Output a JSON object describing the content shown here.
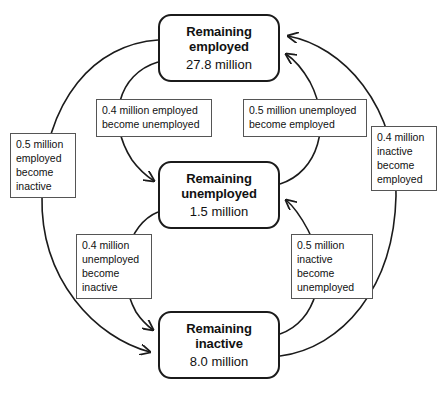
{
  "diagram": {
    "type": "labour-market-flow-cycle",
    "states": [
      {
        "id": "employed",
        "title": "Remaining\nemployed",
        "title_line1": "Remaining",
        "title_line2": "employed",
        "value": "27.8 million"
      },
      {
        "id": "unemployed",
        "title_line1": "Remaining",
        "title_line2": "unemployed",
        "value": "1.5 million"
      },
      {
        "id": "inactive",
        "title_line1": "Remaining",
        "title_line2": "inactive",
        "value": "8.0 million"
      }
    ],
    "flows": [
      {
        "id": "employed-to-unemployed",
        "from": "employed",
        "to": "unemployed",
        "amount": "0.4 million",
        "text": "0.4 million employed become unemployed",
        "line1": "0.4 million employed",
        "line2": "become unemployed"
      },
      {
        "id": "unemployed-to-employed",
        "from": "unemployed",
        "to": "employed",
        "amount": "0.5 million",
        "text": "0.5 million unemployed become employed",
        "line1": "0.5 million unemployed",
        "line2": "become employed"
      },
      {
        "id": "unemployed-to-inactive",
        "from": "unemployed",
        "to": "inactive",
        "amount": "0.4 million",
        "text": "0.4 million unemployed become inactive",
        "line1": "0.4 million",
        "line2": "unemployed",
        "line3": "become",
        "line4": "inactive"
      },
      {
        "id": "inactive-to-unemployed",
        "from": "inactive",
        "to": "unemployed",
        "amount": "0.5 million",
        "text": "0.5 million inactive become unemployed",
        "line1": "0.5 million",
        "line2": "inactive",
        "line3": "become",
        "line4": "unemployed"
      },
      {
        "id": "employed-to-inactive",
        "from": "employed",
        "to": "inactive",
        "amount": "0.5 million",
        "text": "0.5 million employed become inactive",
        "line1": "0.5 million",
        "line2": "employed",
        "line3": "become",
        "line4": "inactive"
      },
      {
        "id": "inactive-to-employed",
        "from": "inactive",
        "to": "employed",
        "amount": "0.4 million",
        "text": "0.4 million inactive become employed",
        "line1": "0.4 million",
        "line2": "inactive",
        "line3": "become",
        "line4": "employed"
      }
    ],
    "colors": {
      "background": "#ffffff",
      "state_border": "#1b1b1b",
      "label_border": "#555555",
      "arrow": "#1b1b1b",
      "text": "#111111"
    }
  }
}
